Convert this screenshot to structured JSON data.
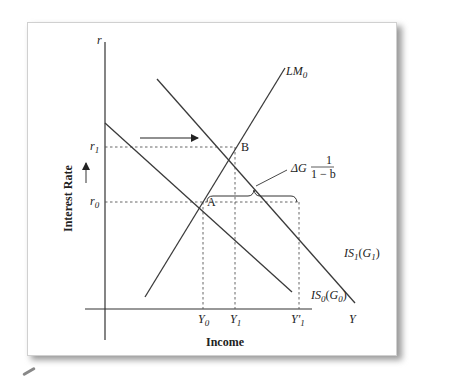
{
  "diagram": {
    "axes": {
      "y_axis_symbol": "r",
      "x_axis_symbol": "Y",
      "y_axis_title": "Interest Rate",
      "x_axis_title": "Income"
    },
    "y_ticks": [
      {
        "base": "r",
        "sub": "1"
      },
      {
        "base": "r",
        "sub": "0"
      }
    ],
    "x_ticks": [
      {
        "base": "Y",
        "sub": "0",
        "prime": ""
      },
      {
        "base": "Y",
        "sub": "1",
        "prime": ""
      },
      {
        "base": "Y",
        "sub": "1",
        "prime": "′"
      }
    ],
    "curves": {
      "lm": {
        "base": "LM",
        "sub": "0"
      },
      "is1": {
        "base": "IS",
        "sub": "1",
        "arg_base": "G",
        "arg_sub": "1"
      },
      "is0": {
        "base": "IS",
        "sub": "0",
        "arg_base": "G",
        "arg_sub": "0"
      }
    },
    "points": {
      "a": "A",
      "b": "B"
    },
    "annotation": {
      "prefix": "ΔG",
      "numerator": "1",
      "denominator": "1 − b"
    },
    "colors": {
      "line": "#3a3a3a",
      "dashed": "#555555",
      "panel_border_shadow": "#9a9a9a"
    }
  }
}
